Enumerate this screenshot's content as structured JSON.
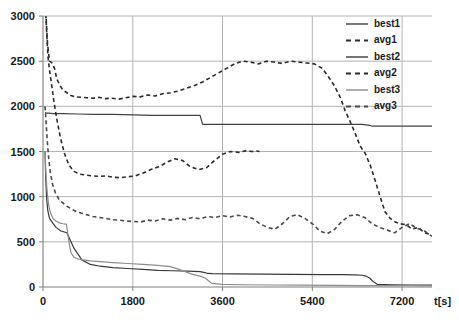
{
  "chart_data": {
    "type": "line",
    "title": "",
    "xlabel": "t[s]",
    "ylabel": "",
    "xlim": [
      0,
      7800
    ],
    "ylim": [
      0,
      3000
    ],
    "grid": true,
    "legend_position": "top-right",
    "xticks": [
      0,
      1800,
      3600,
      5400,
      7200
    ],
    "xtick_labels": [
      "0",
      "1800",
      "3600",
      "5400",
      "7200"
    ],
    "yticks": [
      0,
      500,
      1000,
      1500,
      2000,
      2500,
      3000
    ],
    "ytick_labels": [
      "0",
      "500",
      "1000",
      "1500",
      "2000",
      "2500",
      "3000"
    ],
    "series": [
      {
        "name": "best1",
        "style": "solid",
        "color": "#404040",
        "x": [
          40,
          45,
          50,
          60,
          80,
          120,
          200,
          400,
          700,
          1000,
          1400,
          1800,
          2200,
          2600,
          3000,
          3150,
          3200,
          3600,
          4200,
          4800,
          5400,
          6000,
          6400,
          6550,
          6600,
          6900,
          7200,
          7500,
          7800
        ],
        "y": [
          1930,
          1930,
          1930,
          1925,
          1925,
          1925,
          1920,
          1920,
          1915,
          1910,
          1910,
          1905,
          1900,
          1900,
          1900,
          1900,
          1800,
          1800,
          1800,
          1800,
          1800,
          1800,
          1800,
          1790,
          1780,
          1780,
          1780,
          1780,
          1780
        ]
      },
      {
        "name": "avg1",
        "style": "dashed",
        "color": "#2b2b2b",
        "x": [
          40,
          60,
          90,
          130,
          180,
          230,
          280,
          340,
          400,
          480,
          560,
          650,
          760,
          880,
          1000,
          1120,
          1250,
          1380,
          1520,
          1660,
          1800,
          1950,
          2100,
          2250,
          2400,
          2560,
          2720,
          2880,
          3040,
          3200,
          3360,
          3520,
          3680,
          3840,
          4000,
          4160,
          4320,
          4480,
          4640,
          4800,
          4960,
          5120,
          5280,
          5440,
          5600,
          5720,
          5840,
          5960,
          6060,
          6160,
          6260,
          6360,
          6460,
          6560,
          6660,
          6760,
          6860,
          6960,
          7060,
          7160,
          7280,
          7400,
          7520,
          7650,
          7780
        ],
        "y": [
          3200,
          3000,
          2700,
          2500,
          2480,
          2420,
          2300,
          2230,
          2180,
          2150,
          2120,
          2105,
          2100,
          2095,
          2090,
          2100,
          2085,
          2090,
          2080,
          2095,
          2110,
          2105,
          2125,
          2115,
          2140,
          2150,
          2170,
          2200,
          2230,
          2270,
          2320,
          2370,
          2420,
          2470,
          2500,
          2490,
          2470,
          2500,
          2490,
          2475,
          2500,
          2490,
          2480,
          2470,
          2420,
          2330,
          2230,
          2100,
          1950,
          1830,
          1700,
          1560,
          1480,
          1350,
          1180,
          1000,
          830,
          760,
          720,
          700,
          690,
          640,
          660,
          600,
          580
        ]
      },
      {
        "name": "best2",
        "style": "solid",
        "color": "#3a3a3a",
        "x": [
          40,
          42,
          45,
          55,
          70,
          95,
          130,
          180,
          260,
          360,
          480,
          620,
          780,
          950,
          1150,
          1400,
          1700,
          2000,
          2300,
          2600,
          2900,
          3150,
          3250,
          3300,
          3400,
          3800,
          4400,
          5000,
          5600,
          6000,
          6250,
          6400,
          6480,
          6550,
          6620,
          6700,
          7000,
          7400,
          7800
        ],
        "y": [
          1500,
          1490,
          1400,
          1200,
          1000,
          850,
          760,
          720,
          660,
          620,
          600,
          430,
          300,
          250,
          230,
          215,
          205,
          195,
          185,
          180,
          175,
          170,
          160,
          150,
          148,
          145,
          142,
          140,
          138,
          136,
          135,
          130,
          120,
          100,
          60,
          30,
          25,
          22,
          20
        ]
      },
      {
        "name": "avg2",
        "style": "dashed",
        "color": "#2b2b2b",
        "x": [
          40,
          55,
          75,
          100,
          130,
          170,
          220,
          280,
          350,
          430,
          520,
          620,
          730,
          850,
          980,
          1120,
          1260,
          1400,
          1550,
          1700,
          1850,
          2000,
          2160,
          2320,
          2480,
          2640,
          2800,
          2960,
          3120,
          3280,
          3440,
          3600,
          3760,
          3920,
          4080,
          4180,
          4280,
          4340
        ],
        "y": [
          3250,
          3050,
          2800,
          2550,
          2400,
          2250,
          2050,
          1850,
          1650,
          1480,
          1350,
          1280,
          1250,
          1240,
          1230,
          1225,
          1230,
          1215,
          1210,
          1220,
          1230,
          1260,
          1300,
          1330,
          1380,
          1420,
          1400,
          1330,
          1300,
          1320,
          1400,
          1470,
          1500,
          1490,
          1510,
          1500,
          1505,
          1500
        ]
      },
      {
        "name": "best3",
        "style": "solid",
        "color": "#8c8c8c",
        "x": [
          40,
          45,
          55,
          70,
          90,
          115,
          150,
          200,
          260,
          330,
          400,
          470,
          520,
          560,
          620,
          700,
          800,
          950,
          1150,
          1400,
          1700,
          2000,
          2300,
          2550,
          2700,
          2850,
          3000,
          3150,
          3250,
          3320,
          3380,
          3600,
          4000,
          4600,
          5200,
          5800,
          6400,
          7000,
          7400,
          7800
        ],
        "y": [
          1500,
          1460,
          1300,
          1150,
          1020,
          900,
          820,
          760,
          730,
          710,
          700,
          695,
          500,
          380,
          330,
          310,
          300,
          290,
          280,
          270,
          260,
          250,
          240,
          225,
          200,
          170,
          140,
          120,
          100,
          70,
          40,
          30,
          25,
          22,
          20,
          18,
          16,
          15,
          14,
          13
        ]
      },
      {
        "name": "avg3",
        "style": "dashed",
        "color": "#4a4a4a",
        "x": [
          40,
          60,
          85,
          115,
          150,
          195,
          250,
          310,
          380,
          460,
          550,
          650,
          760,
          880,
          1000,
          1130,
          1260,
          1400,
          1540,
          1680,
          1820,
          1960,
          2100,
          2250,
          2400,
          2550,
          2700,
          2850,
          3000,
          3150,
          3300,
          3450,
          3600,
          3750,
          3900,
          4050,
          4200,
          4350,
          4500,
          4650,
          4800,
          4950,
          5100,
          5250,
          5400,
          5550,
          5700,
          5850,
          6000,
          6150,
          6300,
          6450,
          6600,
          6750,
          6900,
          7050,
          7200,
          7350,
          7500,
          7650,
          7800
        ],
        "y": [
          2000,
          1850,
          1620,
          1420,
          1260,
          1130,
          1040,
          980,
          940,
          900,
          870,
          840,
          820,
          800,
          780,
          770,
          760,
          745,
          740,
          730,
          725,
          720,
          740,
          730,
          755,
          740,
          760,
          745,
          770,
          755,
          780,
          770,
          790,
          775,
          795,
          780,
          760,
          700,
          660,
          640,
          700,
          780,
          800,
          760,
          700,
          620,
          590,
          640,
          730,
          790,
          800,
          770,
          700,
          660,
          630,
          600,
          660,
          700,
          650,
          620,
          560
        ]
      }
    ]
  },
  "legend": {
    "items": [
      {
        "label": "best1",
        "style": "solid",
        "color": "#404040"
      },
      {
        "label": "avg1",
        "style": "dashed",
        "color": "#2b2b2b"
      },
      {
        "label": "best2",
        "style": "solid",
        "color": "#3a3a3a"
      },
      {
        "label": "avg2",
        "style": "dashed",
        "color": "#2b2b2b"
      },
      {
        "label": "best3",
        "style": "solid",
        "color": "#8c8c8c"
      },
      {
        "label": "avg3",
        "style": "dashed",
        "color": "#4a4a4a"
      }
    ]
  }
}
